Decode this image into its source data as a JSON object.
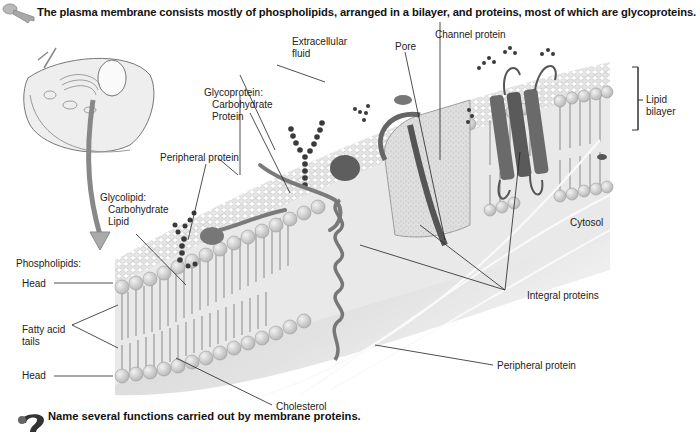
{
  "header": {
    "icon": "key-icon",
    "title": "The plasma membrane consists mostly of phospholipids, arranged in a bilayer, and proteins, most of which are glycoproteins."
  },
  "labels": {
    "extracellular_fluid_1": "Extracellular",
    "extracellular_fluid_2": "fluid",
    "pore": "Pore",
    "channel_protein": "Channel protein",
    "lipid_bilayer_1": "Lipid",
    "lipid_bilayer_2": "bilayer",
    "glycoprotein_1": "Glycoprotein:",
    "glycoprotein_2": "Carbohydrate",
    "glycoprotein_3": "Protein",
    "peripheral_protein_top": "Peripheral protein",
    "glycolipid_1": "Glycolipid:",
    "glycolipid_2": "Carbohydrate",
    "glycolipid_3": "Lipid",
    "cytosol": "Cytosol",
    "phospholipids": "Phospholipids:",
    "head_top": "Head",
    "fatty_acid_1": "Fatty acid",
    "fatty_acid_2": "tails",
    "head_bottom": "Head",
    "integral_proteins": "Integral proteins",
    "peripheral_protein_bottom": "Peripheral protein",
    "cholesterol": "Cholesterol"
  },
  "footer": {
    "icon": "question-mark-icon",
    "question": "Name several functions carried out by membrane proteins."
  },
  "colors": {
    "membrane_surface": "#d9d9d9",
    "lipid_head": "#cfcfcf",
    "protein_dark": "#6a6a6a",
    "carbohydrate": "#3a3a3a",
    "cytosol": "#e6e6e6"
  }
}
